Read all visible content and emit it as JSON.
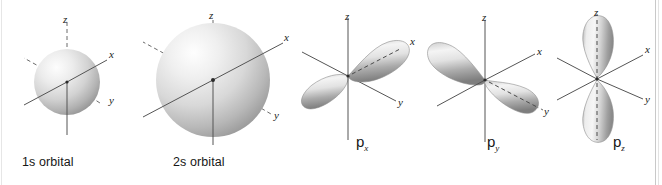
{
  "figure": {
    "background": "#ffffff",
    "axis_color": "#5a5a5a",
    "orbital_fill_light": "#f2f2f2",
    "orbital_fill_dark": "#8a8a8a",
    "label_color": "#171717"
  },
  "axes": {
    "z": "z",
    "x": "x",
    "y": "y"
  },
  "orbitals": [
    {
      "id": "1s",
      "label": "1s orbital",
      "type": "sphere",
      "shape": "spherical",
      "radius_px": 33,
      "axis_labels": {
        "z": "z",
        "x": "x",
        "y": "y"
      }
    },
    {
      "id": "2s",
      "label": "2s orbital",
      "type": "sphere",
      "shape": "spherical",
      "radius_px": 57,
      "axis_labels": {
        "z": "z",
        "x": "x",
        "y": "y"
      }
    },
    {
      "id": "px",
      "label_main": "p",
      "label_sub": "x",
      "type": "dumbbell",
      "shape": "two lobes along x-axis",
      "axis_labels": {
        "z": "z",
        "x": "x",
        "y": "y"
      }
    },
    {
      "id": "py",
      "label_main": "p",
      "label_sub": "y",
      "type": "dumbbell",
      "shape": "two lobes along y-axis",
      "axis_labels": {
        "z": "z",
        "x": "x",
        "y": "y"
      }
    },
    {
      "id": "pz",
      "label_main": "p",
      "label_sub": "z",
      "type": "dumbbell",
      "shape": "two lobes along z-axis",
      "axis_labels": {
        "z": "z",
        "x": "x",
        "y": "y"
      }
    }
  ]
}
